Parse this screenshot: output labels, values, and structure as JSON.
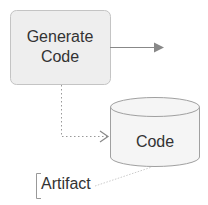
{
  "diagram": {
    "nodes": [
      {
        "id": "generate-code",
        "type": "activity",
        "label_lines": [
          "Generate",
          "Code"
        ],
        "fill": "#eeeeee",
        "stroke": "#bbbbbb"
      },
      {
        "id": "code",
        "type": "datastore-cylinder",
        "label": "Code",
        "fill": "#f5f5f5",
        "stroke": "#999999"
      }
    ],
    "annotations": [
      {
        "id": "artifact",
        "label": "Artifact",
        "attached_to": "code"
      }
    ],
    "edges": [
      {
        "from": "generate-code",
        "to": "outgoing",
        "style": "solid",
        "arrow": "filled"
      },
      {
        "from": "generate-code",
        "to": "code",
        "style": "dotted",
        "arrow": "open"
      }
    ],
    "colors": {
      "line": "#888888",
      "text": "#333333"
    }
  }
}
